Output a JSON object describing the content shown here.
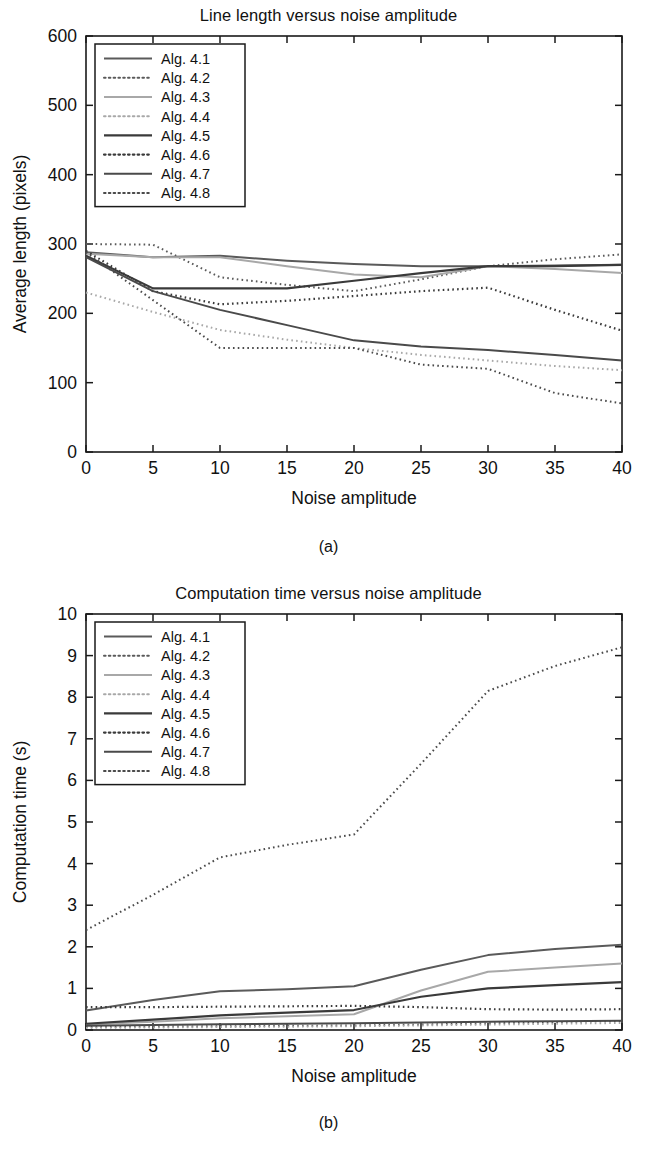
{
  "figures": [
    {
      "id": "a",
      "caption": "(a)",
      "chart_data": {
        "type": "line",
        "title": "Line length versus noise amplitude",
        "xlabel": "Noise amplitude",
        "ylabel": "Average length (pixels)",
        "xlim": [
          0,
          40
        ],
        "ylim": [
          0,
          600
        ],
        "xticks": [
          0,
          5,
          10,
          15,
          20,
          25,
          30,
          35,
          40
        ],
        "yticks": [
          0,
          100,
          200,
          300,
          400,
          500,
          600
        ],
        "grid": false,
        "legend_position": "upper-left",
        "x": [
          0,
          5,
          10,
          15,
          20,
          25,
          30,
          35,
          40
        ],
        "series": [
          {
            "name": "Alg. 4.1",
            "style": "solid",
            "color": "#5a5a5a",
            "width": 2.0,
            "values": [
              288,
              281,
              283,
              276,
              271,
              268,
              268,
              269,
              270
            ]
          },
          {
            "name": "Alg. 4.2",
            "style": "dotted",
            "color": "#5a5a5a",
            "width": 2.0,
            "values": [
              300,
              299,
              252,
              241,
              232,
              249,
              268,
              278,
              285
            ]
          },
          {
            "name": "Alg. 4.3",
            "style": "solid",
            "color": "#a8a8a8",
            "width": 2.0,
            "values": [
              286,
              281,
              281,
              268,
              256,
              252,
              268,
              264,
              258
            ]
          },
          {
            "name": "Alg. 4.4",
            "style": "dotted",
            "color": "#a8a8a8",
            "width": 2.0,
            "values": [
              230,
              202,
              176,
              162,
              150,
              140,
              132,
              124,
              118
            ]
          },
          {
            "name": "Alg. 4.5",
            "style": "solid",
            "color": "#3a3a3a",
            "width": 2.2,
            "values": [
              283,
              236,
              236,
              236,
              247,
              258,
              268,
              268,
              270
            ]
          },
          {
            "name": "Alg. 4.6",
            "style": "dotted",
            "color": "#3a3a3a",
            "width": 2.2,
            "values": [
              290,
              232,
              213,
              218,
              225,
              232,
              237,
              205,
              70
            ]
          },
          {
            "name": "Alg. 4.7",
            "style": "solid",
            "color": "#4a4a4a",
            "width": 2.0,
            "values": [
              281,
              232,
              205,
              183,
              161,
              152,
              147,
              140,
              132
            ]
          },
          {
            "name": "Alg. 4.8",
            "style": "dotted",
            "color": "#4a4a4a",
            "width": 2.0,
            "values": [
              288,
              219,
              150,
              150,
              150,
              126,
              120,
              113,
              112
            ]
          }
        ],
        "series_overrides": {
          "Alg. 4.6": {
            "x": [
              0,
              5,
              10,
              15,
              20,
              25,
              30,
              35,
              40
            ],
            "values": [
              290,
              232,
              213,
              218,
              225,
              232,
              237,
              205,
              175
            ]
          },
          "Alg. 4.8": {
            "x": [
              0,
              5,
              10,
              15,
              20,
              25,
              30,
              35,
              40
            ],
            "values": [
              288,
              219,
              150,
              150,
              150,
              126,
              120,
              85,
              70
            ]
          }
        }
      }
    },
    {
      "id": "b",
      "caption": "(b)",
      "chart_data": {
        "type": "line",
        "title": "Computation time versus noise amplitude",
        "xlabel": "Noise amplitude",
        "ylabel": "Computation time (s)",
        "xlim": [
          0,
          40
        ],
        "ylim": [
          0,
          10
        ],
        "xticks": [
          0,
          5,
          10,
          15,
          20,
          25,
          30,
          35,
          40
        ],
        "yticks": [
          0,
          1,
          2,
          3,
          4,
          5,
          6,
          7,
          8,
          9,
          10
        ],
        "grid": false,
        "legend_position": "upper-left",
        "x": [
          0,
          5,
          10,
          15,
          20,
          25,
          30,
          35,
          40
        ],
        "series": [
          {
            "name": "Alg. 4.1",
            "style": "solid",
            "color": "#5a5a5a",
            "width": 2.0,
            "values": [
              0.47,
              0.72,
              0.93,
              0.98,
              1.05,
              1.45,
              1.8,
              1.95,
              2.05
            ]
          },
          {
            "name": "Alg. 4.2",
            "style": "dotted",
            "color": "#5a5a5a",
            "width": 2.0,
            "values": [
              0.07,
              0.08,
              0.09,
              0.1,
              0.11,
              0.13,
              0.16,
              0.19,
              0.22
            ]
          },
          {
            "name": "Alg. 4.3",
            "style": "solid",
            "color": "#a8a8a8",
            "width": 2.0,
            "values": [
              0.13,
              0.2,
              0.28,
              0.33,
              0.38,
              0.95,
              1.4,
              1.5,
              1.6
            ]
          },
          {
            "name": "Alg. 4.4",
            "style": "dotted",
            "color": "#a8a8a8",
            "width": 2.0,
            "values": [
              0.05,
              0.06,
              0.07,
              0.08,
              0.09,
              0.11,
              0.13,
              0.15,
              0.17
            ]
          },
          {
            "name": "Alg. 4.5",
            "style": "solid",
            "color": "#3a3a3a",
            "width": 2.2,
            "values": [
              0.15,
              0.25,
              0.35,
              0.42,
              0.48,
              0.8,
              1.0,
              1.08,
              1.15
            ]
          },
          {
            "name": "Alg. 4.6",
            "style": "dotted",
            "color": "#3a3a3a",
            "width": 2.2,
            "values": [
              0.55,
              0.55,
              0.56,
              0.57,
              0.58,
              0.55,
              0.5,
              0.49,
              0.5
            ]
          },
          {
            "name": "Alg. 4.7",
            "style": "solid",
            "color": "#4a4a4a",
            "width": 2.0,
            "values": [
              0.1,
              0.12,
              0.14,
              0.15,
              0.16,
              0.18,
              0.2,
              0.21,
              0.22
            ]
          },
          {
            "name": "Alg. 4.8",
            "style": "dotted",
            "color": "#4a4a4a",
            "width": 2.0,
            "values": [
              2.4,
              3.25,
              4.15,
              4.45,
              4.7,
              6.4,
              8.15,
              8.75,
              9.2
            ]
          }
        ]
      }
    }
  ]
}
